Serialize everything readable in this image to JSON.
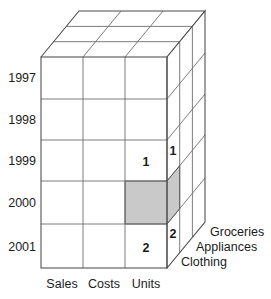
{
  "figure": {
    "type": "olap-cube-diagram",
    "title": "",
    "colors": {
      "background": "#ffffff",
      "edge": "#6e6e6e",
      "edge_outer": "#4a4a4a",
      "cell_fill": "#ffffff",
      "highlight_fill": "#c9c9c9",
      "text": "#1b1b1b"
    }
  },
  "axes": {
    "rows": {
      "name": "time",
      "labels": [
        "1997",
        "1998",
        "1999",
        "2000",
        "2001"
      ]
    },
    "columns": {
      "name": "measures",
      "labels": [
        "Sales",
        "Costs",
        "Units"
      ]
    },
    "depth": {
      "name": "product",
      "labels": [
        "Groceries",
        "Appliances",
        "Clothing"
      ]
    }
  },
  "cells": {
    "front": [
      {
        "row": "1999",
        "column": "Units",
        "value": "1"
      },
      {
        "row": "2001",
        "column": "Units",
        "value": "2"
      }
    ],
    "side": [
      {
        "row": "1999",
        "value": "1"
      },
      {
        "row": "2001",
        "value": "2"
      }
    ],
    "highlighted": {
      "row": "2000",
      "column": "Units",
      "depth": "Clothing",
      "value": ""
    }
  },
  "geometry": {
    "front_left_x": 41,
    "front_right_x": 167,
    "front_top_y": 57,
    "front_bottom_y": 268,
    "col_dividers_x": [
      83,
      125
    ],
    "row_dividers_y": [
      99,
      140,
      181,
      224
    ],
    "depth_dx": 12.7,
    "depth_dy": -15.3,
    "depth_slices": 3
  }
}
